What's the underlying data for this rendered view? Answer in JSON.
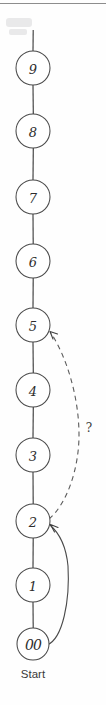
{
  "diagram": {
    "background_color": "#fefefe",
    "stroke_color": "#4a4a4a",
    "nodes": [
      {
        "id": "n9",
        "label": "9",
        "cx": 33,
        "cy": 68,
        "r": 17
      },
      {
        "id": "n8",
        "label": "8",
        "cx": 33,
        "cy": 131,
        "r": 17
      },
      {
        "id": "n7",
        "label": "7",
        "cx": 33,
        "cy": 197,
        "r": 17
      },
      {
        "id": "n6",
        "label": "6",
        "cx": 33,
        "cy": 261,
        "r": 17
      },
      {
        "id": "n5",
        "label": "5",
        "cx": 33,
        "cy": 325,
        "r": 17
      },
      {
        "id": "n4",
        "label": "4",
        "cx": 33,
        "cy": 390,
        "r": 17
      },
      {
        "id": "n3",
        "label": "3",
        "cx": 33,
        "cy": 455,
        "r": 17
      },
      {
        "id": "n2",
        "label": "2",
        "cx": 33,
        "cy": 521,
        "r": 17
      },
      {
        "id": "n1",
        "label": "1",
        "cx": 33,
        "cy": 585,
        "r": 17
      },
      {
        "id": "n0",
        "label": "00",
        "cx": 33,
        "cy": 644,
        "r": 16
      }
    ],
    "start": {
      "node_id": "n0",
      "caption": "Start",
      "caption_x": 33,
      "caption_y": 674
    },
    "edges": [
      {
        "from": "n0",
        "to": "n1",
        "style": "solid",
        "kind": "chain"
      },
      {
        "from": "n1",
        "to": "n2",
        "style": "solid",
        "kind": "chain"
      },
      {
        "from": "n2",
        "to": "n3",
        "style": "solid",
        "kind": "chain"
      },
      {
        "from": "n3",
        "to": "n4",
        "style": "solid",
        "kind": "chain"
      },
      {
        "from": "n4",
        "to": "n5",
        "style": "solid",
        "kind": "chain"
      },
      {
        "from": "n5",
        "to": "n6",
        "style": "solid",
        "kind": "chain"
      },
      {
        "from": "n6",
        "to": "n7",
        "style": "solid",
        "kind": "chain"
      },
      {
        "from": "n7",
        "to": "n8",
        "style": "solid",
        "kind": "chain"
      },
      {
        "from": "n8",
        "to": "n9",
        "style": "solid",
        "kind": "chain"
      },
      {
        "from": "n9",
        "to": "top",
        "style": "solid",
        "kind": "stub"
      },
      {
        "from": "n0",
        "to": "n2",
        "style": "solid",
        "kind": "feedback",
        "arrow": true
      },
      {
        "from": "n2",
        "to": "n5",
        "style": "dashed",
        "kind": "feedback",
        "arrow": true,
        "label": "?"
      }
    ],
    "annotation": {
      "question_mark": "?",
      "x": 89,
      "y": 428
    }
  }
}
